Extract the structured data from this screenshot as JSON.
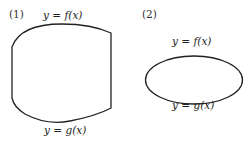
{
  "figure1": {
    "number": "(1)",
    "top_label": "y = f(x)",
    "bottom_label": "y = g(x)"
  },
  "figure2": {
    "number": "(2)",
    "top_label": "y = f(x)",
    "bottom_label": "y = g(x)"
  },
  "colors": {
    "stroke": "#222222",
    "background": "#ffffff"
  }
}
